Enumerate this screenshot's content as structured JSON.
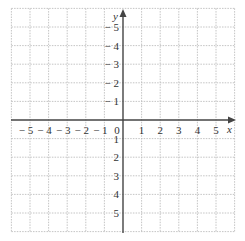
{
  "chart_data": {
    "type": "coordinate-grid",
    "title": "",
    "xlabel": "x",
    "ylabel": "y",
    "xlim": [
      -6,
      6
    ],
    "ylim": [
      -6,
      6
    ],
    "grid": true,
    "grid_style": "dotted",
    "x_ticks": [
      -5,
      -4,
      -3,
      -2,
      -1,
      0,
      1,
      2,
      3,
      4,
      5
    ],
    "y_ticks": [
      -5,
      -4,
      -3,
      -2,
      -1,
      1,
      2,
      3,
      4,
      5
    ],
    "x_tick_labels": [
      "− 5",
      "− 4",
      "− 3",
      "− 2",
      "− 1",
      "0",
      "1",
      "2",
      "3",
      "4",
      "5"
    ],
    "y_tick_labels": [
      "5",
      "4",
      "3",
      "2",
      "1",
      "− 1",
      "− 2",
      "− 3",
      "− 4",
      "− 5"
    ],
    "data_points": []
  },
  "axes": {
    "x_label": "x",
    "y_label": "y",
    "origin_label": "0"
  },
  "colors": {
    "axis": "#444444",
    "grid": "#bdbdbd",
    "text": "#333333"
  }
}
